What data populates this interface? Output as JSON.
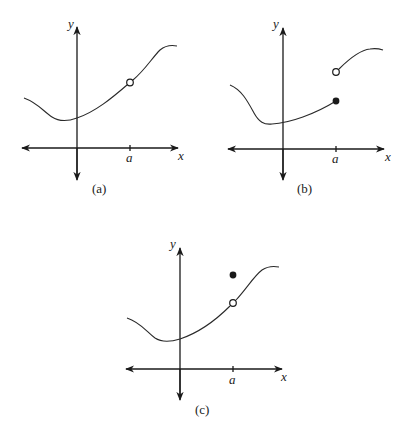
{
  "figure": {
    "panels": [
      {
        "id": "a",
        "caption": "(a)",
        "x_axis_label": "x",
        "y_axis_label": "y",
        "tick_label": "a",
        "description": "Continuous curve with a hole (open circle) at x = a; no point defined at x = a",
        "markers": [
          {
            "type": "open",
            "at": "a"
          }
        ]
      },
      {
        "id": "b",
        "caption": "(b)",
        "x_axis_label": "x",
        "y_axis_label": "y",
        "tick_label": "a",
        "description": "Jump discontinuity at x = a: left branch ends at filled dot, right branch starts at open circle above",
        "markers": [
          {
            "type": "filled",
            "at": "a",
            "position": "lower"
          },
          {
            "type": "open",
            "at": "a",
            "position": "upper"
          }
        ]
      },
      {
        "id": "c",
        "caption": "(c)",
        "x_axis_label": "x",
        "y_axis_label": "y",
        "tick_label": "a",
        "description": "Removable discontinuity at x = a: curve has open circle at x = a, function value is a filled dot above the curve",
        "markers": [
          {
            "type": "open",
            "at": "a",
            "position": "on-curve"
          },
          {
            "type": "filled",
            "at": "a",
            "position": "above"
          }
        ]
      }
    ]
  },
  "colors": {
    "ink": "#1a1a1a",
    "background": "#ffffff"
  }
}
